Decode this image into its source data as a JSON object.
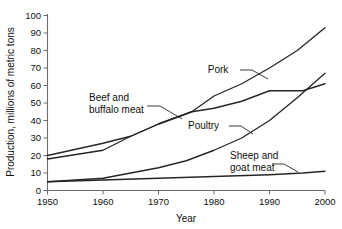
{
  "chart_data": {
    "type": "line",
    "title": "",
    "xlabel": "Year",
    "ylabel": "Production, millions of metric tons",
    "xlim": [
      1950,
      2000
    ],
    "ylim": [
      0,
      100
    ],
    "xticks": [
      1950,
      1960,
      1970,
      1980,
      1990,
      2000
    ],
    "yticks": [
      0,
      10,
      20,
      30,
      40,
      50,
      60,
      70,
      80,
      90,
      100
    ],
    "grid": false,
    "legend": "inline-annotations",
    "series": [
      {
        "name": "Pork",
        "label": "Pork",
        "x": [
          1950,
          1960,
          1965,
          1970,
          1976,
          1980,
          1985,
          1990,
          1995,
          2000
        ],
        "values": [
          18,
          23,
          31,
          38,
          45,
          54,
          61,
          70,
          80,
          93
        ]
      },
      {
        "name": "Beef and buffalo meat",
        "label": "Beef and buffalo meat",
        "x": [
          1950,
          1960,
          1965,
          1970,
          1976,
          1980,
          1985,
          1990,
          1996,
          2000
        ],
        "values": [
          20,
          27,
          31,
          38,
          45,
          47,
          51,
          57,
          57,
          61
        ]
      },
      {
        "name": "Poultry",
        "label": "Poultry",
        "x": [
          1950,
          1960,
          1965,
          1970,
          1975,
          1980,
          1985,
          1990,
          1995,
          2000
        ],
        "values": [
          5,
          7,
          10,
          13,
          17,
          23,
          30,
          40,
          53,
          67
        ]
      },
      {
        "name": "Sheep and goat meat",
        "label": "Sheep and goat meat",
        "x": [
          1950,
          1960,
          1970,
          1980,
          1990,
          1996,
          2000
        ],
        "values": [
          5,
          6,
          7,
          8,
          9,
          10,
          11
        ]
      }
    ],
    "annotations": [
      {
        "name": "pork",
        "text_line1": "Pork",
        "text_line2": ""
      },
      {
        "name": "beef",
        "text_line1": "Beef and",
        "text_line2": "buffalo meat"
      },
      {
        "name": "poultry",
        "text_line1": "Poultry",
        "text_line2": ""
      },
      {
        "name": "sheep",
        "text_line1": "Sheep and",
        "text_line2": "goat meat"
      }
    ],
    "colors": {
      "line": "#262626",
      "axis": "#6d6d6d",
      "text": "#111111",
      "background": "#ffffff"
    }
  },
  "axis": {
    "y_title": "Production, millions of metric tons",
    "x_title": "Year",
    "y_ticks": {
      "t0": "0",
      "t1": "10",
      "t2": "20",
      "t3": "30",
      "t4": "40",
      "t5": "50",
      "t6": "60",
      "t7": "70",
      "t8": "80",
      "t9": "90",
      "t10": "100"
    },
    "x_ticks": {
      "t0": "1950",
      "t1": "1960",
      "t2": "1970",
      "t3": "1980",
      "t4": "1990",
      "t5": "2000"
    }
  },
  "labels": {
    "pork": "Pork",
    "beef_line1": "Beef and",
    "beef_line2": "buffalo meat",
    "poultry": "Poultry",
    "sheep_line1": "Sheep and",
    "sheep_line2": "goat meat"
  }
}
